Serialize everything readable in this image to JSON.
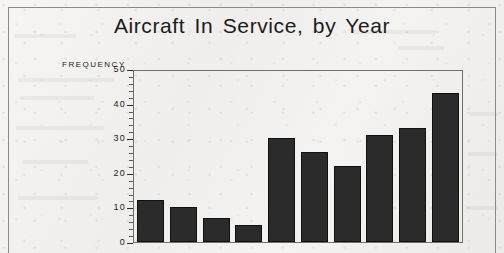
{
  "figure": {
    "title": "Aircraft In Service, by Year",
    "y_axis_title": "FREQUENCY"
  },
  "chart_data": {
    "type": "bar",
    "title": "Aircraft In Service, by Year",
    "xlabel": "",
    "ylabel": "FREQUENCY",
    "ylim": [
      0,
      50
    ],
    "ytick_labels": [
      "50",
      "40",
      "30",
      "20",
      "10",
      "0"
    ],
    "yticks": [
      50,
      40,
      30,
      20,
      10,
      0
    ],
    "minor_tick_interval": 2,
    "grid": false,
    "legend": null,
    "categories": [
      "1",
      "2",
      "3",
      "4",
      "5",
      "6",
      "7",
      "8",
      "9",
      "10"
    ],
    "values": [
      12,
      10,
      7,
      5,
      30,
      26,
      22,
      31,
      33,
      43
    ],
    "bar_color": "#2b2b2b",
    "background_color": "#f2f1ef"
  }
}
